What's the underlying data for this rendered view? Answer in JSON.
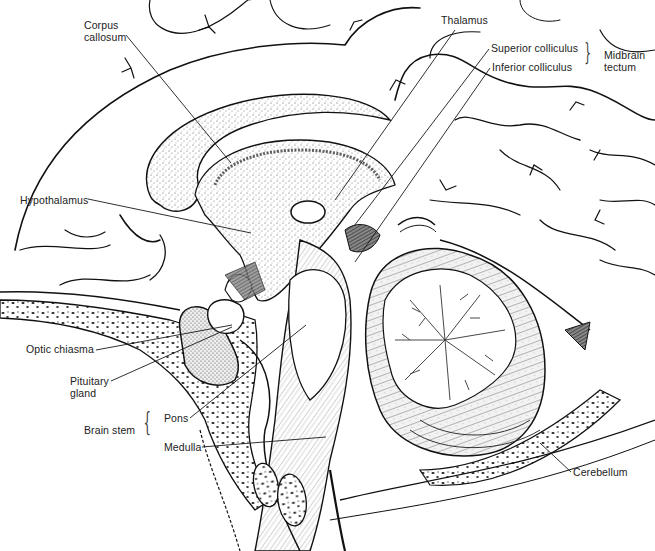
{
  "figure": {
    "top_left_fragment": "",
    "colors": {
      "ink": "#111111",
      "stipple": "#555555",
      "paper": "#ffffff"
    }
  },
  "labels": [
    {
      "id": "corpus-callosum",
      "text": "Corpus\ncallosum",
      "x": 84,
      "y": 19,
      "line": [
        [
          126,
          35
        ],
        [
          231,
          163
        ]
      ]
    },
    {
      "id": "thalamus",
      "text": "Thalamus",
      "x": 441,
      "y": 14,
      "line": [
        [
          455,
          30
        ],
        [
          335,
          200
        ]
      ]
    },
    {
      "id": "superior-colliculus",
      "text": "Superior colliculus",
      "x": 491,
      "y": 42,
      "line": [
        [
          489,
          49
        ],
        [
          354,
          226
        ]
      ]
    },
    {
      "id": "inferior-colliculus",
      "text": "Inferior colliculus",
      "x": 492,
      "y": 61,
      "line": [
        [
          490,
          68
        ],
        [
          355,
          262
        ]
      ]
    },
    {
      "id": "hypothalamus",
      "text": "Hypothalamus",
      "x": 20,
      "y": 194,
      "line": [
        [
          88,
          199
        ],
        [
          251,
          233
        ]
      ]
    },
    {
      "id": "optic-chiasma",
      "text": "Optic chiasma",
      "x": 26,
      "y": 343,
      "line": [
        [
          96,
          350
        ],
        [
          232,
          325
        ]
      ]
    },
    {
      "id": "pituitary-gland",
      "text": "Pituitary\ngland",
      "x": 70,
      "y": 375,
      "line": [
        [
          111,
          381
        ],
        [
          232,
          327
        ]
      ]
    },
    {
      "id": "pons",
      "text": "Pons",
      "x": 164,
      "y": 412,
      "line": [
        [
          190,
          418
        ],
        [
          306,
          325
        ]
      ]
    },
    {
      "id": "medulla",
      "text": "Medulla",
      "x": 164,
      "y": 441,
      "line": [
        [
          202,
          447
        ],
        [
          326,
          437
        ]
      ]
    },
    {
      "id": "cerebellum",
      "text": "Cerebellum",
      "x": 573,
      "y": 466,
      "line": [
        [
          571,
          472
        ],
        [
          540,
          443
        ]
      ]
    }
  ],
  "groups": [
    {
      "id": "midbrain-tectum",
      "text": "Midbrain\ntectum",
      "x": 604,
      "y": 49,
      "brace_x": 583,
      "brace_y": 40
    },
    {
      "id": "brain-stem",
      "text": "Brain stem",
      "x": 84,
      "y": 424,
      "brace_x": 143,
      "brace_y": 411
    }
  ]
}
